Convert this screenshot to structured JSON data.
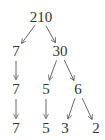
{
  "diagram": {
    "type": "factor-tree",
    "nodes": [
      {
        "id": "n210",
        "label": "210",
        "x": 41,
        "y": 17
      },
      {
        "id": "n7a",
        "label": "7",
        "x": 16,
        "y": 51
      },
      {
        "id": "n30",
        "label": "30",
        "x": 60,
        "y": 51
      },
      {
        "id": "n7b",
        "label": "7",
        "x": 16,
        "y": 89
      },
      {
        "id": "n5a",
        "label": "5",
        "x": 46,
        "y": 89
      },
      {
        "id": "n6",
        "label": "6",
        "x": 78,
        "y": 89
      },
      {
        "id": "n7c",
        "label": "7",
        "x": 16,
        "y": 128
      },
      {
        "id": "n5b",
        "label": "5",
        "x": 46,
        "y": 128
      },
      {
        "id": "n3",
        "label": "3",
        "x": 65,
        "y": 128
      },
      {
        "id": "n2",
        "label": "2",
        "x": 96,
        "y": 128
      }
    ],
    "edges": [
      {
        "from": "n210",
        "to": "n7a"
      },
      {
        "from": "n210",
        "to": "n30"
      },
      {
        "from": "n7a",
        "to": "n7b"
      },
      {
        "from": "n30",
        "to": "n5a"
      },
      {
        "from": "n30",
        "to": "n6"
      },
      {
        "from": "n7b",
        "to": "n7c"
      },
      {
        "from": "n5a",
        "to": "n5b"
      },
      {
        "from": "n6",
        "to": "n3"
      },
      {
        "from": "n6",
        "to": "n2"
      }
    ],
    "colors": {
      "text": "#333333",
      "edge": "#555555"
    }
  }
}
